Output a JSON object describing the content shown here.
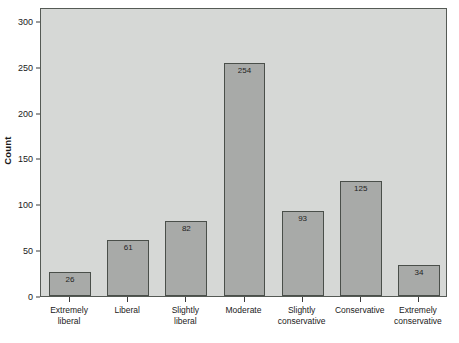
{
  "chart_data": {
    "type": "bar",
    "title": "",
    "subtitle": "",
    "xlabel": "",
    "ylabel": "Count",
    "categories": [
      "Extremely liberal",
      "Liberal",
      "Slightly liberal",
      "Moderate",
      "Slightly conservative",
      "Conservative",
      "Extremely conservative"
    ],
    "category_lines": [
      [
        "Extremely",
        "liberal"
      ],
      [
        "Liberal",
        ""
      ],
      [
        "Slightly",
        "liberal"
      ],
      [
        "Moderate",
        ""
      ],
      [
        "Slightly",
        "conservative"
      ],
      [
        "Conservative",
        ""
      ],
      [
        "Extremely",
        "conservative"
      ]
    ],
    "values": [
      26,
      61,
      82,
      254,
      93,
      125,
      34
    ],
    "value_labels": [
      "26",
      "61",
      "82",
      "254",
      "93",
      "125",
      "34"
    ],
    "ylim": [
      0,
      315
    ],
    "yticks": [
      0,
      50,
      100,
      150,
      200,
      250,
      300
    ],
    "ytick_labels": [
      "0",
      "50",
      "100",
      "150",
      "200",
      "250",
      "300"
    ],
    "grid": false,
    "legend": false,
    "bar_color": "#a8aaa8",
    "bar_edge_color": "#4a4f4a",
    "plot_background": "#d6d8d6",
    "figure_background": "#ffffff",
    "axis_color": "#3a3a3a",
    "text_color": "#1a1a1a"
  }
}
